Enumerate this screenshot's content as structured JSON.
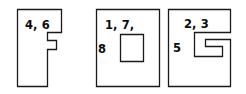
{
  "figure": {
    "background_color": "#ffffff",
    "stroke_color": "#1a1a1a",
    "text_color": "#0d0d0d",
    "shapes": [
      {
        "id": "shape-f",
        "name": "f-shape-polygon",
        "description": "F-shaped rectilinear polygon with a notch and a protruding tab on the right side",
        "labels": [
          {
            "text": "4, 6",
            "x": 25,
            "y": 29
          }
        ],
        "path": "M 17.5 9.5 L 61.5 9.5 L 61.5 32.5 L 47.5 32.5 L 47.5 40.5 L 56.5 40.5 L 56.5 49.5 L 47.5 49.5 L 47.5 86.5 L 17.5 86.5 Z"
      },
      {
        "id": "shape-rect-hole",
        "name": "rectangle-with-hole-polygon",
        "description": "Upright rectangle containing a smaller rectangular hole",
        "labels": [
          {
            "text": "1, 7,",
            "x": 105,
            "y": 29
          },
          {
            "text": "8",
            "x": 98,
            "y": 53
          }
        ],
        "path": "M 96.5 9.5 L 159.5 9.5 L 159.5 86.5 L 96.5 86.5 Z",
        "hole_path": "M 120.5 34.5 L 143.5 34.5 L 143.5 61.5 L 120.5 61.5 Z"
      },
      {
        "id": "shape-g-notch",
        "name": "g-notch-polygon",
        "description": "Rectangle with a spiral G-shaped notch cut into the upper right region",
        "labels": [
          {
            "text": "2, 3",
            "x": 184,
            "y": 28
          },
          {
            "text": "5",
            "x": 173,
            "y": 52
          }
        ],
        "path": "M 168.5 9.5 L 230.5 9.5 L 230.5 32.5 L 194.5 32.5 L 194.5 56.5 L 222.5 56.5 L 222.5 46.5 L 205.5 46.5 L 205.5 39.5 L 230.5 39.5 L 230.5 86.5 L 168.5 86.5 Z"
      }
    ]
  }
}
